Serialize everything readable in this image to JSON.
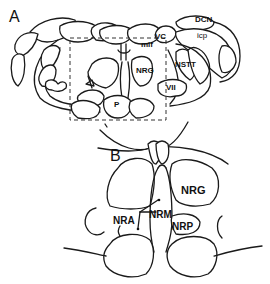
{
  "figure": {
    "panel_a": {
      "letter": "A",
      "labels": {
        "dcn": "DCN",
        "vc": "VC",
        "icp": "icp",
        "mlf": "mlf",
        "nrg": "NRG",
        "nstt": "NSTT",
        "vii": "VII",
        "p": "P"
      }
    },
    "panel_b": {
      "letter": "B",
      "labels": {
        "nrg": "NRG",
        "nra": "NRA",
        "nrm": "NRM",
        "nrp": "NRP"
      }
    }
  }
}
